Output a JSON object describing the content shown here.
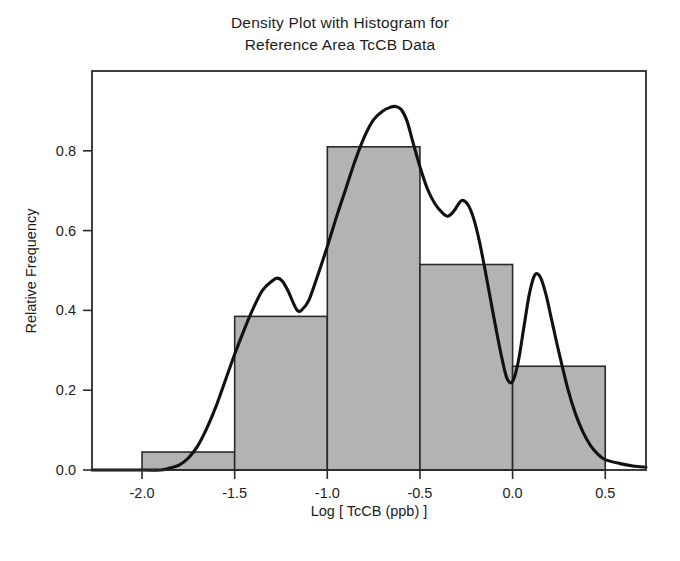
{
  "figure": {
    "title_lines": [
      "Density Plot with Histogram for",
      "Reference Area TcCB Data"
    ],
    "background_color": "#ffffff",
    "frame_color": "#2a2a2a"
  },
  "chart_data": {
    "type": "bar",
    "title": "Density Plot with Histogram for Reference Area TcCB Data",
    "xlabel": "Log [ TcCB (ppb) ]",
    "ylabel": "Relative Frequency",
    "xlim": [
      -2.27,
      0.72
    ],
    "ylim": [
      0.0,
      1.0
    ],
    "grid": false,
    "legend": "none",
    "xticks": [
      -2.0,
      -1.5,
      -1.0,
      -0.5,
      0.0,
      0.5
    ],
    "xticklabels": [
      "-2.0",
      "-1.5",
      "-1.0",
      "-0.5",
      "0.0",
      "0.5"
    ],
    "yticks": [
      0.0,
      0.2,
      0.4,
      0.6,
      0.8
    ],
    "yticklabels": [
      "0.0",
      "0.2",
      "0.4",
      "0.6",
      "0.8"
    ],
    "bar_fill_color": "#b3b3b3",
    "bar_edge_color": "#2a2a2a",
    "curve_color": "#111111",
    "histogram": {
      "bin_edges": [
        -2.0,
        -1.5,
        -1.0,
        -0.5,
        0.0,
        0.5
      ],
      "bin_centers": [
        -1.75,
        -1.25,
        -0.75,
        -0.25,
        0.25
      ],
      "values": [
        0.045,
        0.385,
        0.81,
        0.515,
        0.26
      ]
    },
    "series": [
      {
        "name": "Kernel density estimate",
        "type": "line",
        "x": [
          -2.27,
          -2.0,
          -1.9,
          -1.85,
          -1.8,
          -1.75,
          -1.7,
          -1.65,
          -1.6,
          -1.55,
          -1.5,
          -1.45,
          -1.4,
          -1.35,
          -1.3,
          -1.27,
          -1.24,
          -1.21,
          -1.18,
          -1.16,
          -1.14,
          -1.1,
          -1.05,
          -1.0,
          -0.95,
          -0.9,
          -0.85,
          -0.8,
          -0.75,
          -0.7,
          -0.66,
          -0.63,
          -0.6,
          -0.57,
          -0.54,
          -0.5,
          -0.46,
          -0.42,
          -0.38,
          -0.35,
          -0.32,
          -0.29,
          -0.27,
          -0.24,
          -0.21,
          -0.18,
          -0.15,
          -0.12,
          -0.09,
          -0.06,
          -0.03,
          0.0,
          0.03,
          0.06,
          0.09,
          0.12,
          0.15,
          0.18,
          0.21,
          0.25,
          0.3,
          0.34,
          0.38,
          0.42,
          0.46,
          0.5,
          0.58,
          0.65,
          0.72
        ],
        "y": [
          0.0,
          0.0,
          0.0,
          0.005,
          0.012,
          0.03,
          0.06,
          0.105,
          0.16,
          0.225,
          0.29,
          0.35,
          0.405,
          0.45,
          0.473,
          0.481,
          0.472,
          0.447,
          0.415,
          0.399,
          0.4,
          0.425,
          0.49,
          0.56,
          0.635,
          0.705,
          0.775,
          0.835,
          0.878,
          0.9,
          0.909,
          0.911,
          0.903,
          0.875,
          0.825,
          0.76,
          0.705,
          0.668,
          0.645,
          0.636,
          0.647,
          0.668,
          0.676,
          0.664,
          0.63,
          0.575,
          0.505,
          0.43,
          0.355,
          0.285,
          0.229,
          0.222,
          0.27,
          0.355,
          0.44,
          0.489,
          0.483,
          0.44,
          0.378,
          0.295,
          0.2,
          0.14,
          0.095,
          0.062,
          0.04,
          0.026,
          0.016,
          0.01,
          0.007
        ]
      }
    ]
  }
}
